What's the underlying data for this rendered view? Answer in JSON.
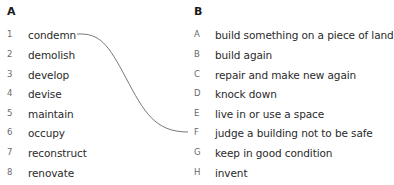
{
  "column_a": {
    "heading": "A",
    "items": [
      {
        "number": "1",
        "word": "condemn"
      },
      {
        "number": "2",
        "word": "demolish"
      },
      {
        "number": "3",
        "word": "develop"
      },
      {
        "number": "4",
        "word": "devise"
      },
      {
        "number": "5",
        "word": "maintain"
      },
      {
        "number": "6",
        "word": "occupy"
      },
      {
        "number": "7",
        "word": "reconstruct"
      },
      {
        "number": "8",
        "word": "renovate"
      }
    ]
  },
  "column_b": {
    "heading": "B",
    "items": [
      {
        "letter": "A",
        "definition": "build something on a piece of land"
      },
      {
        "letter": "B",
        "definition": "build again"
      },
      {
        "letter": "C",
        "definition": "repair and make new again"
      },
      {
        "letter": "D",
        "definition": "knock down"
      },
      {
        "letter": "E",
        "definition": "live in or use a space"
      },
      {
        "letter": "F",
        "definition": "judge a building not to be safe"
      },
      {
        "letter": "G",
        "definition": "keep in good condition"
      },
      {
        "letter": "H",
        "definition": "invent"
      }
    ]
  },
  "example_match": {
    "from": "1",
    "to": "F",
    "line_color": "#555555"
  }
}
